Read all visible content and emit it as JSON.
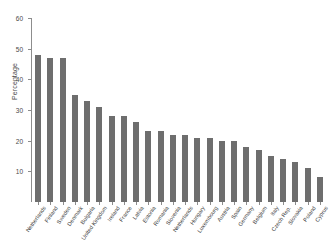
{
  "chart_data": {
    "type": "bar",
    "title": "",
    "xlabel": "",
    "ylabel": "Percentage",
    "ylim": [
      0,
      60
    ],
    "yticks": [
      0,
      10,
      20,
      30,
      40,
      50,
      60
    ],
    "ytick_labels": [
      "0",
      "10",
      "20",
      "30",
      "40",
      "50",
      "60"
    ],
    "grid": false,
    "legend": null,
    "bar_color": "#6e6e6e",
    "axis_color": "#8d8d8d",
    "categories": [
      "Netherlands",
      "Finland",
      "Sweden",
      "Denmark",
      "Bulgaria",
      "United Kingdom",
      "Ireland",
      "France",
      "Latvia",
      "Estonia",
      "Romania",
      "Slovenia",
      "Netherlands",
      "Hungary",
      "Luxembourg",
      "Austria",
      "Spain",
      "Germany",
      "Belgium",
      "Italy",
      "Czech Rep.",
      "Slovakia",
      "Poland",
      "Cyprus"
    ],
    "values": [
      48,
      47,
      47,
      35,
      33,
      31,
      28,
      28,
      26,
      23,
      23,
      22,
      22,
      21,
      21,
      20,
      20,
      18,
      17,
      15,
      14,
      13,
      11,
      8
    ]
  }
}
